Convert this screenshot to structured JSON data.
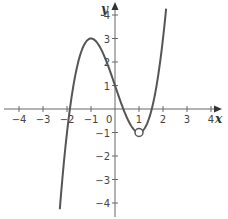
{
  "chart_data": {
    "type": "line",
    "title": "",
    "xlabel": "x",
    "ylabel": "y",
    "xlim": [
      -4.5,
      4.5
    ],
    "ylim": [
      -4.5,
      4.5
    ],
    "x_ticks": [
      -4,
      -3,
      -2,
      -1,
      1,
      2,
      3,
      4
    ],
    "x_tick_labels": [
      "−4",
      "−3",
      "−2",
      "−1",
      "1",
      "2",
      "3",
      "4"
    ],
    "y_ticks": [
      4,
      3,
      2,
      1,
      -1,
      -2,
      -3,
      -4
    ],
    "y_tick_labels": [
      "4",
      "3",
      "2",
      "1",
      "−1",
      "−2",
      "−3",
      "−4"
    ],
    "origin_label": "0",
    "grid": false,
    "legend": null,
    "series": [
      {
        "name": "f(x)",
        "expression": "x^3 - 3x + 1",
        "x_range": [
          -2.3,
          2.13
        ],
        "key_points": [
          {
            "x": -1,
            "y": 3,
            "note": "local maximum"
          },
          {
            "x": 0,
            "y": 1,
            "note": "y-intercept"
          },
          {
            "x": 1,
            "y": -1,
            "note": "local minimum, open circle"
          }
        ],
        "color": "#555555"
      }
    ],
    "annotations": [
      {
        "type": "open-circle",
        "x": 1,
        "y": -1
      }
    ]
  }
}
